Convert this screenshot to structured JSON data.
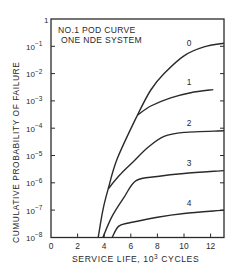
{
  "chart_data": {
    "type": "line",
    "title": "NO.1 POD CURVE",
    "subtitle": "ONE NDE SYSTEM",
    "xlabel": "SERVICE LIFE, 10³ CYCLES",
    "xlabel_base": "SERVICE LIFE, 10",
    "xlabel_exp": "3",
    "xlabel_tail": " CYCLES",
    "ylabel": "CUMULATIVE PROBABILITY OF FAILURE",
    "xlim": [
      0,
      13
    ],
    "ylim": [
      1e-08,
      1
    ],
    "yscale": "log",
    "x_ticks": [
      0,
      2,
      4,
      6,
      8,
      10,
      12
    ],
    "y_ticks": [
      {
        "base": "1",
        "exp": ""
      },
      {
        "base": "10",
        "exp": "−1"
      },
      {
        "base": "10",
        "exp": "−2"
      },
      {
        "base": "10",
        "exp": "−3"
      },
      {
        "base": "10",
        "exp": "−4"
      },
      {
        "base": "10",
        "exp": "−5"
      },
      {
        "base": "10",
        "exp": "−6"
      },
      {
        "base": "10",
        "exp": "−7"
      },
      {
        "base": "10",
        "exp": "−8"
      }
    ],
    "grid": false,
    "legend": "none (inline curve labels)",
    "series": [
      {
        "name": "0",
        "label_at": [
          10.2,
          0.09
        ],
        "points": [
          [
            3.55,
            1e-08
          ],
          [
            3.9,
            1e-07
          ],
          [
            4.3,
            6e-07
          ],
          [
            5.0,
            8e-06
          ],
          [
            6.5,
            0.0003
          ],
          [
            7.5,
            0.0025
          ],
          [
            8.5,
            0.01
          ],
          [
            10,
            0.045
          ],
          [
            11.5,
            0.095
          ],
          [
            13,
            0.13
          ]
        ]
      },
      {
        "name": "1",
        "label_at": [
          10.2,
          0.0032
        ],
        "points": [
          [
            6.5,
            0.0003
          ],
          [
            7.5,
            0.00065
          ],
          [
            9,
            0.0013
          ],
          [
            10.5,
            0.002
          ],
          [
            12.2,
            0.0026
          ]
        ]
      },
      {
        "name": "2",
        "label_at": [
          10.2,
          0.0001
        ],
        "points": [
          [
            4.3,
            6e-07
          ],
          [
            5.2,
            2e-06
          ],
          [
            6.2,
            6e-06
          ],
          [
            7.3,
            2e-05
          ],
          [
            8.5,
            5e-05
          ],
          [
            10,
            7e-05
          ],
          [
            13,
            8e-05
          ]
        ]
      },
      {
        "name": "3",
        "label_at": [
          10.2,
          3.5e-06
        ],
        "points": [
          [
            3.9,
            1e-08
          ],
          [
            4.6,
            6e-08
          ],
          [
            5.5,
            3e-07
          ],
          [
            6.4,
            1.2e-06
          ],
          [
            8,
            1.7e-06
          ],
          [
            10,
            2.2e-06
          ],
          [
            13,
            2.8e-06
          ]
        ]
      },
      {
        "name": "4",
        "label_at": [
          10.2,
          1.2e-07
        ],
        "points": [
          [
            4.6,
            1e-08
          ],
          [
            5.1,
            2.6e-08
          ],
          [
            6,
            3.5e-08
          ],
          [
            8,
            5.5e-08
          ],
          [
            10,
            7.5e-08
          ],
          [
            13,
            1e-07
          ]
        ]
      }
    ]
  },
  "colors": {
    "ink": "#2a2a2a",
    "background": "#ffffff"
  }
}
